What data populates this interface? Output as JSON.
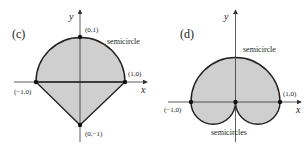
{
  "panels": [
    {
      "id": "c",
      "label": "(c)",
      "axis_x": "x",
      "axis_y": "y",
      "points": [
        "(0,1)",
        "(1,0)",
        "(−1,0)",
        "(0,−1)"
      ],
      "annotation": "semicircle"
    },
    {
      "id": "d",
      "label": "(d)",
      "axis_x": "x",
      "axis_y": "y",
      "points": [
        "(1,0)",
        "(−1,0)"
      ],
      "annotation_top": "semicircle",
      "annotation_bottom": "semicircles"
    }
  ],
  "colors": {
    "fill": "#cfcfcf",
    "stroke": "#222222",
    "axis": "#333333"
  }
}
